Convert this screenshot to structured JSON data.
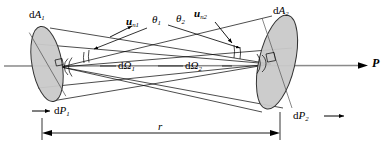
{
  "figure": {
    "type": "radiometry-solid-angle-diagram",
    "background_color": "#ffffff",
    "line_color": "#000000",
    "axis_color": "#808080",
    "surface_fill": "#c8c8c8",
    "surface_stroke": "#3a3a3a"
  },
  "labels": {
    "area_left": {
      "prefix": "d",
      "symbol": "A",
      "sub": "1"
    },
    "area_right": {
      "prefix": "d",
      "symbol": "A",
      "sub": "2"
    },
    "normal_left": {
      "symbol": "u",
      "sub": "n1"
    },
    "normal_right": {
      "symbol": "u",
      "sub": "n2"
    },
    "theta_left": {
      "symbol": "θ",
      "sub": "1"
    },
    "theta_right": {
      "symbol": "θ",
      "sub": "2"
    },
    "solid_angle_left": {
      "prefix": "d",
      "symbol": "Ω",
      "sub": "1"
    },
    "solid_angle_right": {
      "prefix": "d",
      "symbol": "Ω",
      "sub": "2"
    },
    "power_left": {
      "prefix": "d",
      "symbol": "P",
      "sub": "1"
    },
    "power_right": {
      "prefix": "d",
      "symbol": "P",
      "sub": "2"
    },
    "axis_label": {
      "symbol": "P"
    },
    "distance_label": {
      "symbol": "r"
    }
  },
  "geometry": {
    "left_vertex": {
      "x": 61,
      "y": 67
    },
    "right_vertex": {
      "x": 271,
      "y": 64
    },
    "left_ellipse": {
      "cx": 47,
      "cy": 64,
      "rx": 15,
      "ry": 38,
      "rotation": -10
    },
    "right_ellipse": {
      "cx": 277,
      "cy": 62,
      "rx": 18,
      "ry": 48,
      "rotation": 13
    },
    "axis_y": 66,
    "axis_x_start": 4,
    "axis_x_end": 368,
    "dimension_line_y": 133,
    "dimension_x_start": 42,
    "dimension_x_end": 280
  }
}
